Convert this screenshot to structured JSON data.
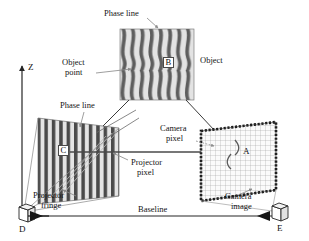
{
  "figure": {
    "type": "structured-light-triangulation-diagram",
    "background": "#ffffff",
    "ink": "#262626"
  },
  "axes": {
    "z_label": "Z",
    "origin_label": "D",
    "right_label": "E",
    "baseline_label": "Baseline"
  },
  "labels": {
    "phase_line_top": "Phase line",
    "phase_line_left": "Phase line",
    "object": "Object",
    "object_point_line1": "Object",
    "object_point_line2": "point",
    "camera_pixel_line1": "Camera",
    "camera_pixel_line2": "pixel",
    "projector_pixel_line1": "Projector",
    "projector_pixel_line2": "pixel",
    "camera_image_line1": "Camera",
    "camera_image_line2": "image",
    "projector_fringe_line1": "Projector",
    "projector_fringe_line2": "fringe"
  },
  "points": {
    "a": "A",
    "b": "B",
    "c": "C",
    "d": "D",
    "e": "E"
  },
  "elements": {
    "object_patch": "wavy-fringe-object-surface",
    "projector_fringe_plane": "vertical-stripe-fringe-plane",
    "camera_image_plane": "pixel-grid-image-plane",
    "projector_device": "projector-icon",
    "camera_device": "camera-icon"
  },
  "colors": {
    "stripe_dark": "#555555",
    "stripe_light": "#d8d8d8",
    "line": "#303030",
    "grid": "#9a9a9a",
    "leader": "#8c8c8c"
  }
}
